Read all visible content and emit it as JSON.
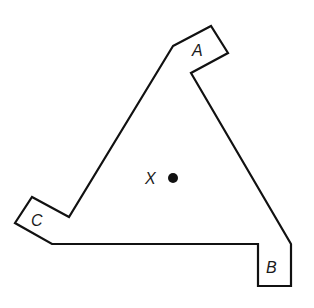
{
  "diagram": {
    "shape": {
      "type": "triangular-plate-with-tabs",
      "stroke": "#111111",
      "fill": "#ffffff",
      "points": [
        [
          173,
          46
        ],
        [
          211,
          26
        ],
        [
          228,
          53
        ],
        [
          191,
          73
        ],
        [
          291,
          244
        ],
        [
          291,
          286
        ],
        [
          258,
          286
        ],
        [
          258,
          244
        ],
        [
          52,
          244
        ],
        [
          15,
          223
        ],
        [
          32,
          197
        ],
        [
          69,
          217
        ]
      ]
    },
    "labels": {
      "a": "A",
      "b": "B",
      "c": "C",
      "x": "X"
    },
    "point_x": {
      "cx": 173,
      "cy": 178,
      "r": 5,
      "color": "#111111"
    }
  }
}
